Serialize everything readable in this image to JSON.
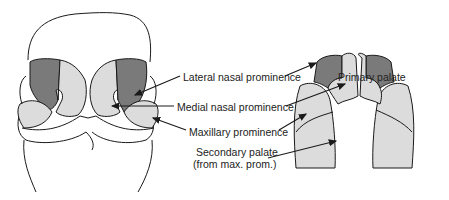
{
  "diagram": {
    "type": "embryology-face-palate",
    "colors": {
      "lateral_nasal": "#7a7a7a",
      "medial_nasal": "#dcdcdc",
      "maxillary": "#dcdcdc",
      "outline": "#1a1a1a",
      "label_text": "#222222"
    },
    "views": [
      {
        "id": "frontal-face",
        "description": "Frontal view of embryonic face"
      },
      {
        "id": "palate",
        "description": "Ventral view of developing palate"
      }
    ],
    "labels": {
      "lateral_nasal": "Lateral nasal prominence",
      "medial_nasal": "Medial nasal prominence",
      "maxillary": "Maxillary prominence",
      "secondary_line1": "Secondary palate",
      "secondary_line2": "(from max. prom.)",
      "primary_palate": "Primary palate"
    }
  }
}
